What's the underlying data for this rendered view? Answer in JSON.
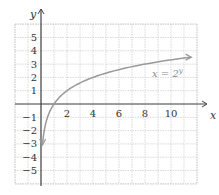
{
  "chart_data": {
    "type": "line",
    "title": "",
    "xlabel": "x",
    "ylabel": "y",
    "xlim": [
      -2,
      12
    ],
    "ylim": [
      -6,
      6
    ],
    "grid": true,
    "x_ticks": [
      2,
      4,
      6,
      8,
      10
    ],
    "y_ticks": [
      5,
      4,
      3,
      2,
      1,
      -1,
      -2,
      -3,
      -4,
      -5
    ],
    "series": [
      {
        "name": "x = 2^y",
        "label_text": "x = 2",
        "label_exponent": "y",
        "function": "y = log2(x)",
        "color": "#999999",
        "x": [
          0.125,
          0.25,
          0.5,
          1,
          2,
          4,
          8,
          11.5
        ],
        "y": [
          -3,
          -2,
          -1,
          0,
          1,
          2,
          3,
          3.52
        ]
      }
    ]
  },
  "colors": {
    "grid": "#c8c8c8",
    "axis": "#444444",
    "curve": "#999999"
  }
}
